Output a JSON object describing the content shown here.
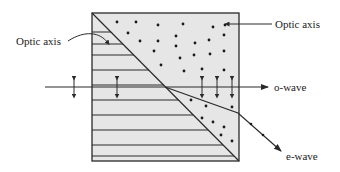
{
  "diagram": {
    "labels": {
      "optic_axis_left": "Optic axis",
      "optic_axis_right": "Optic axis",
      "o_wave": "o-wave",
      "e_wave": "e-wave"
    },
    "colors": {
      "crystal_fill": "#e6e6e6",
      "stroke": "#2a2a2a",
      "background": "#ffffff"
    },
    "crystal": {
      "box": {
        "x": 92,
        "y": 13,
        "w": 147,
        "h": 148
      },
      "upper_region": "optic axis perpendicular to page (dots)",
      "lower_region": "optic axis horizontal (lines)"
    },
    "horizontal_lines_y": [
      32,
      44,
      55,
      70,
      85,
      100,
      115,
      130,
      145,
      156
    ],
    "dots_upper": [
      [
        117,
        22
      ],
      [
        136,
        22
      ],
      [
        158,
        24
      ],
      [
        183,
        24
      ],
      [
        214,
        23
      ],
      [
        227,
        25
      ],
      [
        129,
        33
      ],
      [
        140,
        41
      ],
      [
        158,
        41
      ],
      [
        177,
        38
      ],
      [
        197,
        40
      ],
      [
        178,
        51
      ],
      [
        194,
        47
      ],
      [
        161,
        54
      ],
      [
        176,
        47
      ],
      [
        210,
        45
      ],
      [
        224,
        38
      ],
      [
        214,
        50
      ],
      [
        187,
        60
      ],
      [
        212,
        62
      ],
      [
        178,
        67
      ],
      [
        184,
        43
      ],
      [
        197,
        64
      ],
      [
        227,
        67
      ],
      [
        203,
        55
      ]
    ],
    "dots_lower": [
      [
        202,
        101
      ],
      [
        213,
        107
      ],
      [
        201,
        114
      ],
      [
        221,
        113
      ],
      [
        223,
        123
      ],
      [
        226,
        131
      ],
      [
        241,
        141
      ]
    ],
    "ray": {
      "y": 87,
      "x_start": 45,
      "x_end": 268
    },
    "polarization_arrows_x": [
      74,
      117,
      202,
      217,
      232
    ]
  }
}
